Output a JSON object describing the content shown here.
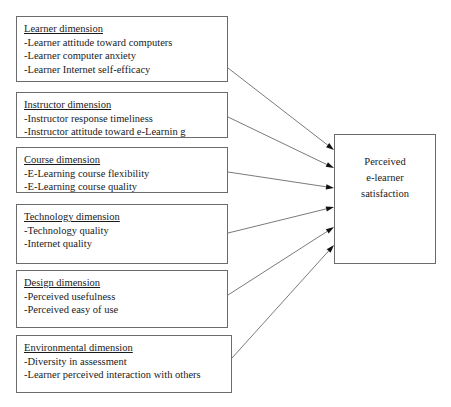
{
  "diagram": {
    "type": "conceptual-model",
    "line_color": "#6b6b6b",
    "text_color": "#1a1a1a",
    "dimensions": [
      {
        "id": "learner",
        "heading": "Learner dimension",
        "items": [
          "-Learner attitude toward computers",
          "-Learner computer anxiety",
          "-Learner Internet self-efficacy"
        ],
        "box": {
          "x": 16,
          "y": 16,
          "w": 212,
          "h": 66
        },
        "arrow_from": {
          "x": 228,
          "y": 68
        }
      },
      {
        "id": "instructor",
        "heading": "Instructor dimension",
        "items": [
          "-Instructor response timeliness",
          "-Instructor attitude toward e-Learnin g"
        ],
        "box": {
          "x": 16,
          "y": 92,
          "w": 212,
          "h": 46
        },
        "arrow_from": {
          "x": 228,
          "y": 117
        }
      },
      {
        "id": "course",
        "heading": "Course dimension",
        "items": [
          "-E-Learning course flexibility",
          "-E-Learning course quality"
        ],
        "box": {
          "x": 16,
          "y": 147,
          "w": 212,
          "h": 46
        },
        "arrow_from": {
          "x": 228,
          "y": 172
        }
      },
      {
        "id": "technology",
        "heading": "Technology dimension",
        "items": [
          "-Technology quality",
          "-Internet quality"
        ],
        "box": {
          "x": 16,
          "y": 204,
          "w": 212,
          "h": 60
        },
        "arrow_from": {
          "x": 228,
          "y": 233
        }
      },
      {
        "id": "design",
        "heading": "Design dimension",
        "items": [
          "-Perceived usefulness",
          "-Perceived easy of use"
        ],
        "box": {
          "x": 16,
          "y": 270,
          "w": 212,
          "h": 58
        },
        "arrow_from": {
          "x": 228,
          "y": 295
        }
      },
      {
        "id": "environmental",
        "heading": "Environmental dimension",
        "items": [
          "-Diversity in assessment",
          "-Learner perceived interaction with others"
        ],
        "box": {
          "x": 16,
          "y": 335,
          "w": 216,
          "h": 58
        },
        "arrow_from": {
          "x": 232,
          "y": 358
        }
      }
    ],
    "outcome": {
      "id": "perceived-e-learner-satisfaction",
      "lines": [
        "Perceived",
        "e-learner",
        "satisfaction"
      ],
      "box": {
        "x": 334,
        "y": 134,
        "w": 102,
        "h": 130
      }
    },
    "arrow_targets": [
      {
        "x": 334,
        "y": 150
      },
      {
        "x": 334,
        "y": 168
      },
      {
        "x": 334,
        "y": 188
      },
      {
        "x": 334,
        "y": 207
      },
      {
        "x": 334,
        "y": 227
      },
      {
        "x": 334,
        "y": 245
      }
    ]
  }
}
